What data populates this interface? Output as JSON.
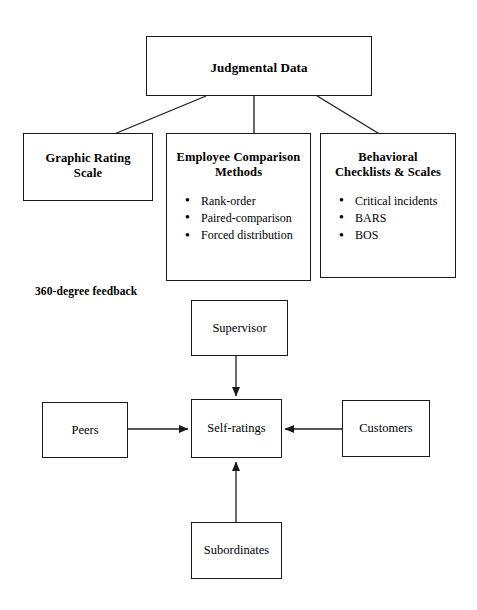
{
  "diagram": {
    "top": {
      "title": "Judgmental Data"
    },
    "categories": [
      {
        "id": "graphic-rating-scale",
        "title_line1": "Graphic Rating",
        "title_line2": "Scale",
        "items": []
      },
      {
        "id": "employee-comparison-methods",
        "title_line1": "Employee Comparison",
        "title_line2": "Methods",
        "items": [
          "Rank-order",
          "Paired-comparison",
          "Forced distribution"
        ]
      },
      {
        "id": "behavioral-checklists-scales",
        "title_line1": "Behavioral",
        "title_line2": "Checklists & Scales",
        "items": [
          "Critical incidents",
          "BARS",
          "BOS"
        ]
      }
    ],
    "feedback": {
      "label": "360-degree feedback",
      "center": "Self-ratings",
      "sources": {
        "top": "Supervisor",
        "left": "Peers",
        "right": "Customers",
        "bottom": "Subordinates"
      }
    },
    "colors": {
      "stroke": "#1a1a1a",
      "background": "#ffffff",
      "text": "#000000"
    }
  }
}
